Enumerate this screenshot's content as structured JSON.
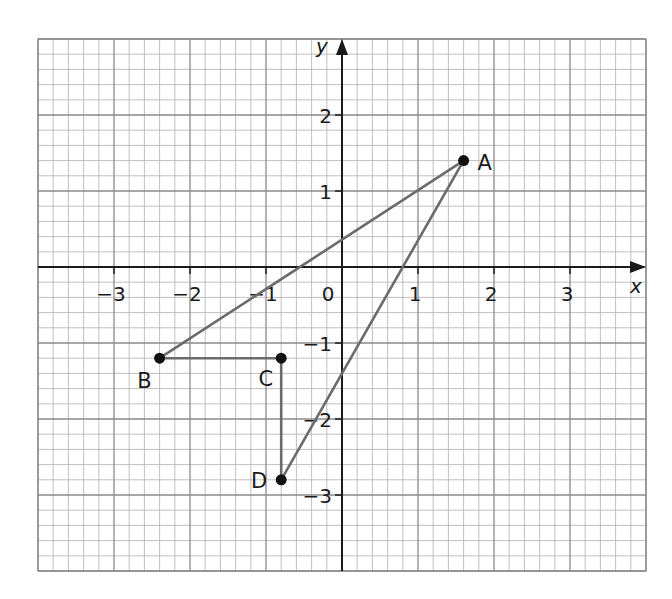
{
  "chart_data": {
    "type": "scatter",
    "title": "",
    "xlabel": "x",
    "ylabel": "y",
    "xlim": [
      -4,
      4
    ],
    "ylim": [
      -4,
      3
    ],
    "grid": true,
    "grid_minor_step": 0.2,
    "grid_major_step": 1,
    "x_ticks": [
      -3,
      -2,
      -1,
      0,
      1,
      2,
      3
    ],
    "y_ticks": [
      -3,
      -2,
      -1,
      1,
      2
    ],
    "x_tick_labels": [
      "−3",
      "−2",
      "−1",
      "0",
      "1",
      "2",
      "3"
    ],
    "y_tick_labels": [
      "−3",
      "−2",
      "−1",
      "1",
      "2"
    ],
    "origin_label": "0",
    "points": [
      {
        "label": "A",
        "x": 1.6,
        "y": 1.4
      },
      {
        "label": "B",
        "x": -2.4,
        "y": -1.2
      },
      {
        "label": "C",
        "x": -0.8,
        "y": -1.2
      },
      {
        "label": "D",
        "x": -0.8,
        "y": -2.8
      }
    ],
    "segments": [
      {
        "from": "A",
        "to": "B"
      },
      {
        "from": "A",
        "to": "D"
      },
      {
        "from": "B",
        "to": "C"
      },
      {
        "from": "C",
        "to": "D"
      }
    ],
    "colors": {
      "grid_minor": "#b8b8b8",
      "grid_major": "#8a8a8a",
      "axis": "#1a1a1a",
      "segment": "#6b6b6b",
      "point": "#111111"
    }
  }
}
